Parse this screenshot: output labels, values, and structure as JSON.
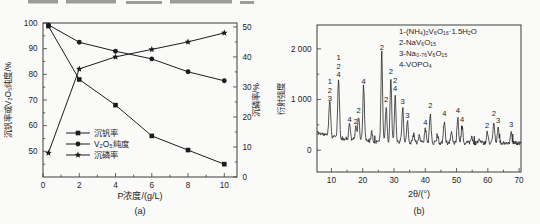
{
  "figure": {
    "paper_color": "#fafaf9",
    "ink_color": "#1c1c1c",
    "frame_color": "#3c3c3c",
    "scan_artifact_color": "#85857f",
    "scan_artifacts_top": [
      [
        28,
        0,
        30,
        3.5
      ],
      [
        66,
        0,
        50,
        3.5
      ],
      [
        126,
        1,
        36,
        3
      ],
      [
        170,
        0,
        62,
        3.5
      ],
      [
        240,
        1,
        14,
        3
      ]
    ]
  },
  "chart_data": [
    {
      "id": "chart-a",
      "type": "line",
      "caption": "(a)",
      "xlabel": "P浓度/(g/L)",
      "ylabel_left": "沉钒率或V₂O₅纯度/%",
      "ylabel_right": "沉磷率/%",
      "x_range": [
        0,
        10.7
      ],
      "x_ticks": [
        0,
        2,
        4,
        6,
        8,
        10
      ],
      "x_minor_ticks": [
        1,
        3,
        5,
        7,
        9
      ],
      "y_left_range": [
        40,
        100
      ],
      "y_left_ticks": [
        50,
        60,
        70,
        80,
        90,
        100
      ],
      "y_left_minor_ticks": [
        45,
        55,
        65,
        75,
        85,
        95
      ],
      "y_right_range": [
        0,
        51.3
      ],
      "y_right_ticks": [
        0,
        10,
        20,
        30,
        40,
        50
      ],
      "y_right_minor_ticks": [
        5,
        15,
        25,
        35,
        45
      ],
      "x": [
        0.3,
        2,
        4,
        6,
        8,
        10
      ],
      "series": [
        {
          "name": "沉钒率",
          "marker": "square",
          "axis": "left",
          "values": [
            98.8,
            78,
            68,
            56,
            50.5,
            45
          ]
        },
        {
          "name": "V₂O₅纯度",
          "marker": "circle",
          "axis": "left",
          "values": [
            99.3,
            92.5,
            89,
            86,
            81,
            77.5
          ]
        },
        {
          "name": "沉磷率",
          "marker": "star",
          "axis": "right",
          "values": [
            8,
            36,
            40,
            42.5,
            45,
            48
          ]
        }
      ],
      "legend_position": "inside-lower-left",
      "grid": false
    },
    {
      "id": "chart-b",
      "type": "line",
      "caption": "(b)",
      "xlabel": "2θ/(°)",
      "ylabel": "衍射强度",
      "x_range": [
        5.4,
        70.6
      ],
      "x_ticks": [
        10,
        20,
        30,
        40,
        50,
        60,
        70
      ],
      "x_minor_ticks": [
        15,
        25,
        35,
        45,
        55,
        65
      ],
      "y_range": [
        -430,
        2470
      ],
      "y_ticks": [
        0,
        1000,
        2000
      ],
      "y_tick_labels": [
        "0",
        "1 000",
        "2 000"
      ],
      "y_minor_ticks": [
        500,
        1500
      ],
      "legend": [
        "1-(NH₄)₂V₆O₁₆·1.5H₂O",
        "2-NaV₆O₁₅",
        "3-Na₀.₇₆V₆O₁₅",
        "4-VOPO₄"
      ],
      "legend_position": "inside-upper-right",
      "grid": false,
      "peaks": [
        {
          "two_theta": 9.5,
          "intensity": 850,
          "labels": [
            "1",
            "2",
            "3"
          ]
        },
        {
          "two_theta": 12.3,
          "intensity": 1320,
          "labels": [
            "1",
            "2",
            "4"
          ]
        },
        {
          "two_theta": 15.8,
          "intensity": 430,
          "labels": [
            "4"
          ]
        },
        {
          "two_theta": 17.8,
          "intensity": 390,
          "labels": [
            "2"
          ]
        },
        {
          "two_theta": 18.7,
          "intensity": 620,
          "labels": [
            "2"
          ]
        },
        {
          "two_theta": 20.3,
          "intensity": 1180,
          "labels": [
            "4"
          ]
        },
        {
          "two_theta": 22.9,
          "intensity": 300,
          "labels": []
        },
        {
          "two_theta": 26.1,
          "intensity": 1850,
          "labels": [
            "2"
          ]
        },
        {
          "two_theta": 27.5,
          "intensity": 830,
          "labels": [
            "2"
          ]
        },
        {
          "two_theta": 29.0,
          "intensity": 1380,
          "labels": [
            "2"
          ]
        },
        {
          "two_theta": 30.4,
          "intensity": 1050,
          "labels": [
            "2",
            "4"
          ]
        },
        {
          "two_theta": 32.8,
          "intensity": 800,
          "labels": [
            "3"
          ]
        },
        {
          "two_theta": 34.3,
          "intensity": 520,
          "labels": [
            "3"
          ]
        },
        {
          "two_theta": 36.3,
          "intensity": 280,
          "labels": []
        },
        {
          "two_theta": 38.1,
          "intensity": 260,
          "labels": []
        },
        {
          "two_theta": 40.0,
          "intensity": 380,
          "labels": [
            "4"
          ]
        },
        {
          "two_theta": 41.6,
          "intensity": 720,
          "labels": [
            "2"
          ]
        },
        {
          "two_theta": 43.9,
          "intensity": 280,
          "labels": []
        },
        {
          "two_theta": 46.1,
          "intensity": 560,
          "labels": [
            "4"
          ]
        },
        {
          "two_theta": 48.4,
          "intensity": 330,
          "labels": []
        },
        {
          "two_theta": 50.4,
          "intensity": 620,
          "labels": [
            "4"
          ]
        },
        {
          "two_theta": 51.8,
          "intensity": 430,
          "labels": [
            "4"
          ]
        },
        {
          "two_theta": 54.8,
          "intensity": 230,
          "labels": []
        },
        {
          "two_theta": 57.2,
          "intensity": 210,
          "labels": []
        },
        {
          "two_theta": 59.8,
          "intensity": 330,
          "labels": [
            "2"
          ]
        },
        {
          "two_theta": 61.9,
          "intensity": 560,
          "labels": [
            "2"
          ]
        },
        {
          "two_theta": 63.3,
          "intensity": 420,
          "labels": [
            "3"
          ]
        },
        {
          "two_theta": 67.4,
          "intensity": 350,
          "labels": [
            "3"
          ]
        }
      ]
    }
  ]
}
